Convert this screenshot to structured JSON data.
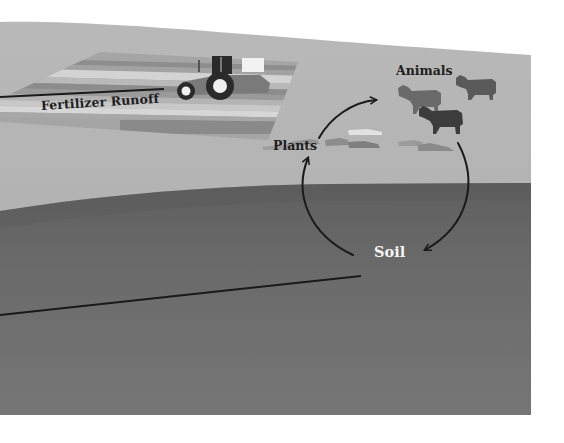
{
  "diagram": {
    "type": "nutrient-cycle-illustration",
    "labels": {
      "fertilizer_runoff": "Fertilizer Runoff",
      "animals": "Animals",
      "plants": "Plants",
      "soil": "Soil"
    },
    "cycle": {
      "nodes": [
        "Plants",
        "Animals",
        "Soil"
      ],
      "edges": [
        {
          "from": "Plants",
          "to": "Animals"
        },
        {
          "from": "Animals",
          "to": "Soil"
        },
        {
          "from": "Soil",
          "to": "Plants"
        }
      ]
    },
    "elements": {
      "tractor_count": 1,
      "cow_count": 3,
      "runoff_lines": 2
    },
    "colors": {
      "sky": "#b4b4b4",
      "ground": "#6e6e6e",
      "soil_dark": "#5e5e5e",
      "field_light": "#d2d2d2",
      "field_mid": "#a8a8a8",
      "field_dark": "#8a8a8a",
      "tractor": "#7a7a7a",
      "tractor_dark": "#2a2a2a",
      "cow_light": "#6a6a6a",
      "cow_dark": "#3a3a3a",
      "arrow": "#1a1a1a",
      "text_dark": "#1e1e1e",
      "text_light": "#f4f4f4",
      "page_bg": "#ffffff"
    }
  }
}
